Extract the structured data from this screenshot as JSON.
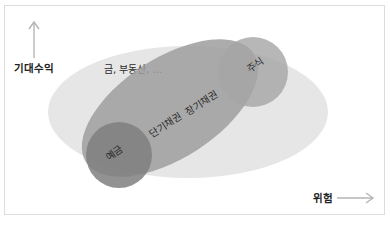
{
  "diagram": {
    "type": "risk-return-map",
    "axes": {
      "y_label": "기대수익",
      "x_label": "위험",
      "y_arrow_icon": "arrow-up-icon",
      "x_arrow_icon": "arrow-right-icon"
    },
    "regions": [
      {
        "id": "alternatives",
        "label": "금, 부동산, ...",
        "color": "#e6e6e6"
      },
      {
        "id": "bonds",
        "label_short": "단기채권",
        "label_long": "장기채권",
        "color": "#9e9e9e"
      },
      {
        "id": "deposits",
        "label": "예금",
        "color": "#7f7f7f"
      },
      {
        "id": "stocks",
        "label": "주식",
        "color": "#a9a9a9"
      }
    ],
    "colors": {
      "border": "#dcdcdc",
      "arrow": "#b5b5b5",
      "text": "#2b2b2b"
    }
  }
}
